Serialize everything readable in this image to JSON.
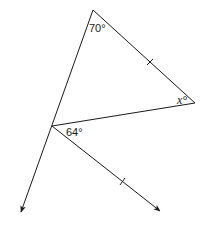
{
  "diagram": {
    "type": "geometry",
    "labels": {
      "top_angle": "70°",
      "right_angle": "x°",
      "bottom_angle": "64°"
    },
    "vertices": {
      "top": [
        93,
        10
      ],
      "right": [
        195,
        103
      ],
      "left": [
        52,
        126
      ]
    },
    "rays": {
      "extended_left_side_tip": [
        21,
        212
      ],
      "lower_ray_tip": [
        160,
        211
      ]
    },
    "tick_marks": [
      {
        "segment": "top-right",
        "at": [
          150,
          62
        ]
      },
      {
        "segment": "lower-ray",
        "at": [
          122,
          182
        ]
      }
    ],
    "colors": {
      "line": "#1a1a1a",
      "background": "#ffffff"
    }
  }
}
